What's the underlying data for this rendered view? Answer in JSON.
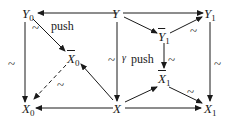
{
  "diagram": {
    "nodes": {
      "Y0": {
        "base": "Y",
        "sub": "0"
      },
      "Y": {
        "base": "Y",
        "sub": ""
      },
      "Y1": {
        "base": "Y",
        "sub": "1"
      },
      "Y1bar": {
        "base": "Y",
        "sub": "1"
      },
      "X0bar": {
        "base": "X",
        "sub": "0"
      },
      "X1bar": {
        "base": "X",
        "sub": "1"
      },
      "X0": {
        "base": "X",
        "sub": "0"
      },
      "X": {
        "base": "X",
        "sub": ""
      },
      "X1": {
        "base": "X",
        "sub": "1"
      }
    },
    "labels": {
      "push_left": "push",
      "push_mid": "push",
      "gamma": "γ",
      "tilde": "~"
    },
    "edges": [
      {
        "from": "Y",
        "to": "Y0",
        "style": "solid"
      },
      {
        "from": "Y",
        "to": "Y1",
        "style": "solid"
      },
      {
        "from": "Y",
        "to": "Y1bar",
        "style": "solid"
      },
      {
        "from": "Y1bar",
        "to": "Y1",
        "style": "solid",
        "label": "~"
      },
      {
        "from": "Y0",
        "to": "X0bar",
        "style": "solid",
        "label": "~"
      },
      {
        "from": "Y0",
        "to": "X0",
        "style": "solid",
        "label": "~"
      },
      {
        "from": "Y",
        "to": "X",
        "style": "solid",
        "label": "~ γ"
      },
      {
        "from": "Y1bar",
        "to": "X1bar",
        "style": "solid",
        "label": "~"
      },
      {
        "from": "Y1",
        "to": "X1",
        "style": "solid",
        "label": "~"
      },
      {
        "from": "X0bar",
        "to": "X0",
        "style": "dashed",
        "label": "~"
      },
      {
        "from": "X",
        "to": "X0bar",
        "style": "solid"
      },
      {
        "from": "X",
        "to": "X0",
        "style": "solid"
      },
      {
        "from": "X",
        "to": "X1bar",
        "style": "solid"
      },
      {
        "from": "X1bar",
        "to": "X1",
        "style": "solid",
        "label": "~"
      },
      {
        "from": "X",
        "to": "X1",
        "style": "solid"
      }
    ]
  }
}
